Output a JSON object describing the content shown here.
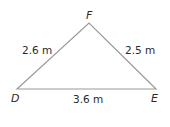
{
  "diagram": {
    "type": "triangle",
    "vertices": [
      {
        "name": "D",
        "label": "D"
      },
      {
        "name": "E",
        "label": "E"
      },
      {
        "name": "F",
        "label": "F"
      }
    ],
    "sides": [
      {
        "between": "D-F",
        "label": "2.6 m"
      },
      {
        "between": "E-F",
        "label": "2.5 m"
      },
      {
        "between": "D-E",
        "label": "3.6 m"
      }
    ],
    "line_color": "#9a9a9a"
  }
}
